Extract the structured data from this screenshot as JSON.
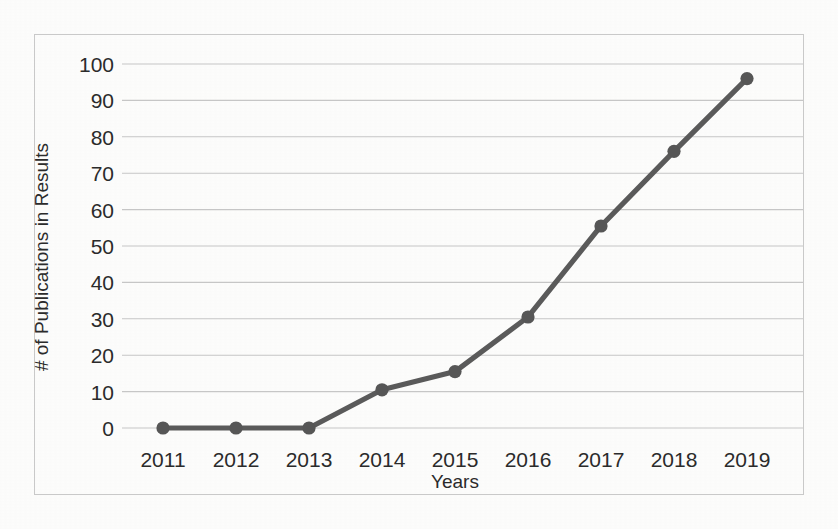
{
  "chart_data": {
    "type": "line",
    "title": "",
    "xlabel": "Years",
    "ylabel": "# of Publications in Results",
    "categories": [
      "2011",
      "2012",
      "2013",
      "2014",
      "2015",
      "2016",
      "2017",
      "2018",
      "2019"
    ],
    "values": [
      0,
      0,
      0,
      10.5,
      15.5,
      30.5,
      55.5,
      76,
      96
    ],
    "series": [
      {
        "name": "# of Publications in Results",
        "values": [
          0,
          0,
          0,
          10.5,
          15.5,
          30.5,
          55.5,
          76,
          96
        ]
      }
    ],
    "ylim": [
      0,
      100
    ],
    "y_ticks": [
      0,
      10,
      20,
      30,
      40,
      50,
      60,
      70,
      80,
      90,
      100
    ],
    "y_tick_labels": [
      "0",
      "10",
      "20",
      "30",
      "40",
      "50",
      "60",
      "70",
      "80",
      "90",
      "100"
    ],
    "grid": true,
    "grid_axis": "y",
    "legend": false,
    "legend_position": "none",
    "marker": "circle",
    "colors": {
      "line": "#5a5a5a",
      "marker": "#565656",
      "gridline": "#c6c6c6",
      "border": "#c9c9c9",
      "text": "#2b2b2b",
      "background": "#fdfdfc"
    }
  }
}
